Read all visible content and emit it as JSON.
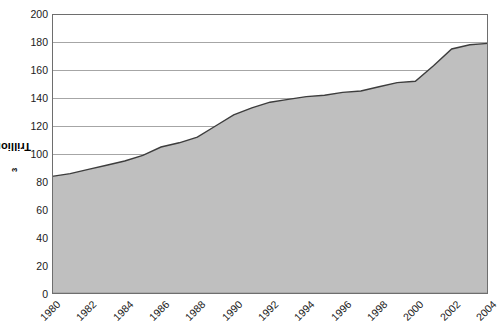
{
  "chart_data": {
    "type": "area",
    "title": "",
    "xlabel": "",
    "ylabel": "Trillion m",
    "ylabel_superscript": "3",
    "ylim": [
      0,
      200
    ],
    "xlim": [
      1980,
      2004
    ],
    "grid": true,
    "legend": "none",
    "y_ticks": [
      200,
      180,
      160,
      140,
      120,
      100,
      80,
      60,
      40,
      20,
      0
    ],
    "x_ticks": [
      1980,
      1982,
      1984,
      1986,
      1988,
      1990,
      1992,
      1994,
      1996,
      1998,
      2000,
      2002,
      2004
    ],
    "x_tick_rotation": -45,
    "x": [
      1980,
      1981,
      1982,
      1983,
      1984,
      1985,
      1986,
      1987,
      1988,
      1989,
      1990,
      1991,
      1992,
      1993,
      1994,
      1995,
      1996,
      1997,
      1998,
      1999,
      2000,
      2001,
      2002,
      2003,
      2004
    ],
    "values": [
      84,
      86,
      89,
      92,
      95,
      99,
      105,
      108,
      112,
      120,
      128,
      133,
      137,
      139,
      141,
      142,
      144,
      145,
      148,
      151,
      152,
      163,
      175,
      178,
      179
    ],
    "series": [
      {
        "name": "Reserves",
        "values": [
          84,
          86,
          89,
          92,
          95,
          99,
          105,
          108,
          112,
          120,
          128,
          133,
          137,
          139,
          141,
          142,
          144,
          145,
          148,
          151,
          152,
          163,
          175,
          178,
          179
        ]
      }
    ],
    "colors": {
      "area_fill": "#bfbfbf",
      "area_line": "#3d3d3d",
      "grid": "#a6a6a6",
      "axis": "#6e6e6e",
      "text": "#1a1a1a"
    }
  }
}
